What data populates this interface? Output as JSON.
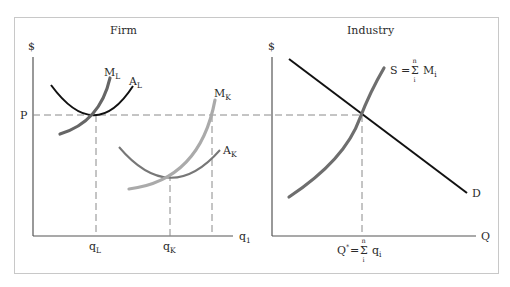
{
  "firm": {
    "title": "Firm",
    "y_axis_label": "$",
    "price_label": "P",
    "x_axis_label": "q",
    "x_axis_sub": "1",
    "curves": {
      "ML": {
        "main": "M",
        "sub": "L"
      },
      "AL": {
        "main": "A",
        "sub": "L"
      },
      "MK": {
        "main": "M",
        "sub": "K"
      },
      "AK": {
        "main": "A",
        "sub": "K"
      }
    },
    "ticks": {
      "qL": {
        "main": "q",
        "sub": "L"
      },
      "qK": {
        "main": "q",
        "sub": "K"
      }
    }
  },
  "industry": {
    "title": "Industry",
    "y_axis_label": "$",
    "x_axis_label": "Q",
    "supply_label": {
      "lhs": "S =",
      "sigma": "Σ",
      "upper": "n",
      "lower": "i",
      "rhs": "M",
      "rhs_sub": "i"
    },
    "demand_label": "D",
    "equilibrium_label": {
      "lhs": "Q",
      "star": "*",
      "eq": "=",
      "sigma": "Σ",
      "upper": "n",
      "lower": "i",
      "rhs": "q",
      "rhs_sub": "i"
    }
  },
  "colors": {
    "frame": "#c8c8c8",
    "axis": "#555555",
    "dash": "#8a8a8a",
    "AL": "#111111",
    "ML": "#666666",
    "MK": "#aaaaaa",
    "AK": "#777777",
    "S": "#6e6e6e",
    "D": "#111111"
  }
}
